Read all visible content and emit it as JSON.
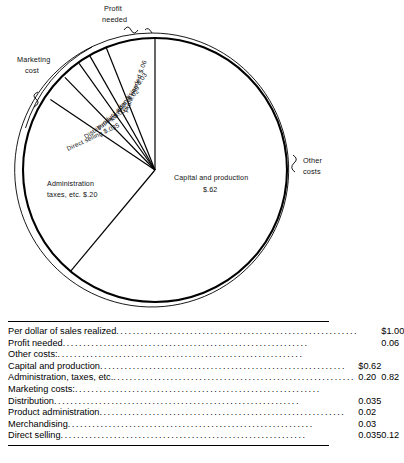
{
  "chart_data": {
    "type": "pie",
    "title": "Per dollar of sales realized",
    "center_label": {
      "line1": "Capital and production",
      "line2": "$.62"
    },
    "categories": [
      "Capital and production",
      "Administration taxes, etc.",
      "Direct selling",
      "Distribution",
      "Product adm.",
      "Merchandising",
      "Profit needed"
    ],
    "values": [
      0.62,
      0.2,
      0.035,
      0.035,
      0.02,
      0.03,
      0.06
    ],
    "slice_labels": [
      "Capital and production $.62",
      "Administration taxes, etc. $.20",
      "Direct selling $.035",
      "Distribution $.035",
      "Product adm. $.02",
      "Merchandising $.03",
      "Profit needed $.06"
    ],
    "grid": false,
    "legend": "none",
    "annotations": [
      "Profit needed",
      "Marketing cost",
      "Other costs"
    ]
  },
  "pie": {
    "labels": {
      "profit_callout_l1": "Profit",
      "profit_callout_l2": "needed",
      "marketing_callout_l1": "Marketing",
      "marketing_callout_l2": "cost",
      "other_callout_l1": "Other",
      "other_callout_l2": "costs",
      "profit_needed": "Profit needed $.06",
      "merchandising": "Merchandising $.03",
      "product_adm": "Product adm. $.02",
      "distribution": "Distribution $.035",
      "direct_selling": "Direct selling $.035",
      "administration_l1": "Administration",
      "administration_l2": "taxes, etc. $.20",
      "capital_l1": "Capital and production",
      "capital_l2": "$.62"
    }
  },
  "table": {
    "rows": [
      {
        "indent": 0,
        "label": "Per dollar of sales realized",
        "leader": true,
        "c1": "",
        "c2": "$1.00"
      },
      {
        "indent": 1,
        "label": "Profit needed",
        "leader": true,
        "c1": "",
        "c2": "0.06"
      },
      {
        "indent": 1,
        "label": "Other costs:",
        "leader": false,
        "c1": "",
        "c2": ""
      },
      {
        "indent": 2,
        "label": "Capital and production",
        "leader": true,
        "c1": "$0.62",
        "c2": ""
      },
      {
        "indent": 2,
        "label": "Administration, taxes, etc.",
        "leader": true,
        "c1": "0.20",
        "c2": "0.82"
      },
      {
        "indent": 3,
        "label": "Marketing costs:",
        "leader": false,
        "c1": "",
        "c2": ""
      },
      {
        "indent": 3,
        "label": "Distribution",
        "leader": true,
        "c1": "0.035",
        "c2": ""
      },
      {
        "indent": 3,
        "label": "Product administration",
        "leader": true,
        "c1": "0.02",
        "c2": ""
      },
      {
        "indent": 3,
        "label": "Merchandising",
        "leader": true,
        "c1": "0.03",
        "c2": ""
      },
      {
        "indent": 3,
        "label": "Direct selling",
        "leader": true,
        "c1": "0.035",
        "c2": "0.12"
      }
    ]
  }
}
